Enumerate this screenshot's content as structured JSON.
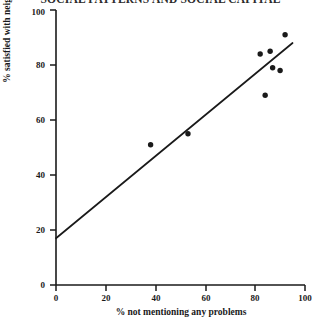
{
  "chart_data": {
    "type": "scatter",
    "title": "SOCIAL PATTERNS AND SOCIAL CAPITAL",
    "xlabel": "% not mentioning any problems",
    "ylabel": "% satisfied with neighbourhood",
    "xlim": [
      0,
      100
    ],
    "ylim": [
      0,
      100
    ],
    "xticks": [
      0,
      20,
      40,
      60,
      80,
      100
    ],
    "yticks": [
      0,
      20,
      40,
      60,
      80,
      100
    ],
    "grid": false,
    "legend": null,
    "points": [
      {
        "x": 38,
        "y": 51
      },
      {
        "x": 53,
        "y": 55
      },
      {
        "x": 84,
        "y": 69
      },
      {
        "x": 82,
        "y": 84
      },
      {
        "x": 86,
        "y": 85
      },
      {
        "x": 87,
        "y": 79
      },
      {
        "x": 90,
        "y": 78
      },
      {
        "x": 92,
        "y": 91
      }
    ],
    "trendline": {
      "label": "fitted regression line",
      "x0": 0,
      "y0": 17,
      "x1": 95,
      "y1": 88
    }
  },
  "axes": {
    "x_tick_labels": [
      "0",
      "20",
      "40",
      "60",
      "80",
      "100"
    ],
    "y_tick_labels": [
      "0",
      "20",
      "40",
      "60",
      "80",
      "100"
    ]
  }
}
